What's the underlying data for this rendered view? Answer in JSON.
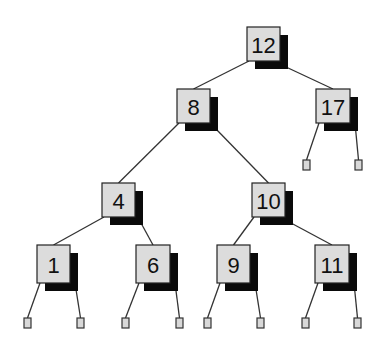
{
  "diagram": {
    "type": "binary-search-tree",
    "colors": {
      "node_fill": "#dcdcdc",
      "node_shadow": "#0a0a0a",
      "edge": "#333333",
      "background": "#ffffff"
    },
    "nodes": [
      {
        "id": "n12",
        "label": "12",
        "x": 247,
        "y": 27,
        "w": 33,
        "h": 34
      },
      {
        "id": "n8",
        "label": "8",
        "x": 177,
        "y": 89,
        "w": 33,
        "h": 34
      },
      {
        "id": "n17",
        "label": "17",
        "x": 316,
        "y": 89,
        "w": 34,
        "h": 34
      },
      {
        "id": "n4",
        "label": "4",
        "x": 102,
        "y": 183,
        "w": 33,
        "h": 34
      },
      {
        "id": "n10",
        "label": "10",
        "x": 252,
        "y": 183,
        "w": 33,
        "h": 34
      },
      {
        "id": "n1",
        "label": "1",
        "x": 37,
        "y": 245,
        "w": 33,
        "h": 38
      },
      {
        "id": "n6",
        "label": "6",
        "x": 136,
        "y": 245,
        "w": 34,
        "h": 38
      },
      {
        "id": "n9",
        "label": "9",
        "x": 217,
        "y": 245,
        "w": 33,
        "h": 38
      },
      {
        "id": "n11",
        "label": "11",
        "x": 315,
        "y": 245,
        "w": 34,
        "h": 38
      }
    ],
    "leaves": [
      {
        "id": "l17a",
        "x": 303,
        "y": 160
      },
      {
        "id": "l17b",
        "x": 355,
        "y": 160
      },
      {
        "id": "l1a",
        "x": 24,
        "y": 318
      },
      {
        "id": "l1b",
        "x": 77,
        "y": 318
      },
      {
        "id": "l6a",
        "x": 122,
        "y": 318
      },
      {
        "id": "l6b",
        "x": 176,
        "y": 318
      },
      {
        "id": "l9a",
        "x": 204,
        "y": 318
      },
      {
        "id": "l9b",
        "x": 257,
        "y": 318
      },
      {
        "id": "l11a",
        "x": 302,
        "y": 318
      },
      {
        "id": "l11b",
        "x": 354,
        "y": 318
      }
    ],
    "edges": [
      {
        "from": "n12",
        "to": "n8"
      },
      {
        "from": "n12",
        "to": "n17"
      },
      {
        "from": "n8",
        "to": "n4"
      },
      {
        "from": "n8",
        "to": "n10"
      },
      {
        "from": "n17",
        "to": "l17a"
      },
      {
        "from": "n17",
        "to": "l17b"
      },
      {
        "from": "n4",
        "to": "n1"
      },
      {
        "from": "n4",
        "to": "n6"
      },
      {
        "from": "n10",
        "to": "n9"
      },
      {
        "from": "n10",
        "to": "n11"
      },
      {
        "from": "n1",
        "to": "l1a"
      },
      {
        "from": "n1",
        "to": "l1b"
      },
      {
        "from": "n6",
        "to": "l6a"
      },
      {
        "from": "n6",
        "to": "l6b"
      },
      {
        "from": "n9",
        "to": "l9a"
      },
      {
        "from": "n9",
        "to": "l9b"
      },
      {
        "from": "n11",
        "to": "l11a"
      },
      {
        "from": "n11",
        "to": "l11b"
      }
    ],
    "leaf_size": {
      "w": 7,
      "h": 10
    },
    "shadow_offset": 8
  }
}
